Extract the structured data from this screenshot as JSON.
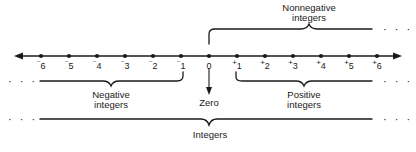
{
  "figure": {
    "type": "number-line-diagram",
    "axis": {
      "name": "integer-number-line",
      "min_shown": -6,
      "max_shown": 6,
      "arrows": [
        "left",
        "right"
      ],
      "ticks": [
        {
          "value": -6,
          "sign": "⁻",
          "digit": "6"
        },
        {
          "value": -5,
          "sign": "⁻",
          "digit": "5"
        },
        {
          "value": -4,
          "sign": "⁻",
          "digit": "4"
        },
        {
          "value": -3,
          "sign": "⁻",
          "digit": "3"
        },
        {
          "value": -2,
          "sign": "⁻",
          "digit": "2"
        },
        {
          "value": -1,
          "sign": "⁻",
          "digit": "1"
        },
        {
          "value": 0,
          "sign": "",
          "digit": "0"
        },
        {
          "value": 1,
          "sign": "+",
          "digit": "1"
        },
        {
          "value": 2,
          "sign": "+",
          "digit": "2"
        },
        {
          "value": 3,
          "sign": "+",
          "digit": "3"
        },
        {
          "value": 4,
          "sign": "+",
          "digit": "4"
        },
        {
          "value": 5,
          "sign": "+",
          "digit": "5"
        },
        {
          "value": 6,
          "sign": "+",
          "digit": "6"
        }
      ]
    },
    "groups": {
      "nonnegative": {
        "line1": "Nonnegative",
        "line2": "integers"
      },
      "negative": {
        "line1": "Negative",
        "line2": "integers"
      },
      "positive": {
        "line1": "Positive",
        "line2": "integers"
      },
      "zero": {
        "line1": "Zero"
      },
      "integers": {
        "line1": "Integers"
      }
    },
    "ellipses": {
      "top_right": "· · ·",
      "mid_left": "· · ·",
      "mid_right": "· · ·",
      "bottom_left": "· · ·",
      "bottom_right": "· · ·"
    },
    "colors": {
      "ink": "#1a1a1a",
      "background": "#ffffff"
    }
  }
}
